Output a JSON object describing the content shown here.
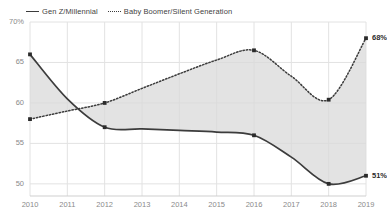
{
  "chart_data": {
    "type": "line",
    "title": "",
    "subtitle": "",
    "xlabel": "",
    "ylabel": "",
    "x": [
      2010,
      2011,
      2012,
      2013,
      2014,
      2015,
      2016,
      2017,
      2018,
      2019
    ],
    "xticklabels": [
      "2010",
      "2011",
      "2012",
      "2013",
      "2014",
      "2015",
      "2016",
      "2017",
      "2018",
      "2019"
    ],
    "yticklabels": [
      "70%",
      "65",
      "60",
      "55",
      "50"
    ],
    "yticks": [
      70,
      65,
      60,
      55,
      50
    ],
    "ylim": [
      48.5,
      70
    ],
    "xlim": [
      2010,
      2019
    ],
    "grid": true,
    "legend_position": "top-left",
    "fill_between": true,
    "fill_color": "#d9d9d9",
    "line_color": "#3c3c3c",
    "series": [
      {
        "name": "Gen Z/Millennial",
        "style": "solid",
        "values": [
          66.0,
          60.5,
          57.0,
          56.8,
          56.6,
          56.4,
          56.0,
          53.3,
          50.0,
          51.0
        ],
        "markers_at": [
          2010,
          2012,
          2016,
          2018,
          2019
        ],
        "end_label": "51%"
      },
      {
        "name": "Baby Boomer/Silent Generation",
        "style": "dotted",
        "values": [
          58.0,
          59.0,
          60.0,
          61.8,
          63.6,
          65.3,
          66.5,
          63.3,
          60.4,
          68.0
        ],
        "markers_at": [
          2010,
          2012,
          2016,
          2018,
          2019
        ],
        "end_label": "68%"
      }
    ],
    "annotations": [
      {
        "text": "68%",
        "series": "Baby Boomer/Silent Generation",
        "x": 2019,
        "y": 68
      },
      {
        "text": "51%",
        "series": "Gen Z/Millennial",
        "x": 2019,
        "y": 51
      }
    ]
  },
  "legend": {
    "items": [
      {
        "label": "Gen Z/Millennial",
        "style": "solid"
      },
      {
        "label": "Baby Boomer/Silent Generation",
        "style": "dotted"
      }
    ]
  }
}
